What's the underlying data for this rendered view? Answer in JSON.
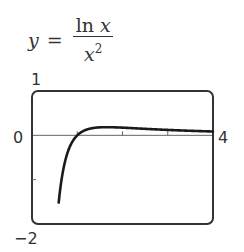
{
  "equation": {
    "lhs": "y",
    "equals": "=",
    "numerator_fn": "ln",
    "numerator_var": "x",
    "denominator_var": "x",
    "denominator_exp": "2"
  },
  "axis_labels": {
    "ymax": "1",
    "ymin": "−2",
    "xmin": "0",
    "xmax": "4"
  },
  "colors": {
    "frame": "#333333",
    "curve": "#1a1a1a",
    "axis": "#555555",
    "text": "#333333"
  },
  "chart_data": {
    "type": "line",
    "function": "ln(x)/x^2",
    "xlabel": "",
    "ylabel": "",
    "xlim": [
      0,
      4
    ],
    "ylim": [
      -2,
      1
    ],
    "x_tick_labels": [
      "0",
      "4"
    ],
    "y_tick_labels": [
      "1",
      "−2"
    ],
    "x_ticks": [
      1,
      2,
      3
    ],
    "y_ticks": [
      -1
    ],
    "grid": false,
    "legend": null,
    "series": [
      {
        "name": "y = ln x / x^2",
        "x": [
          0.6,
          0.7,
          0.8,
          0.9,
          1.0,
          1.25,
          1.5,
          1.65,
          2.0,
          2.5,
          3.0,
          3.5,
          4.0
        ],
        "values": [
          -1.42,
          -0.73,
          -0.35,
          -0.13,
          0.0,
          0.143,
          0.18,
          0.184,
          0.173,
          0.147,
          0.122,
          0.102,
          0.087
        ]
      }
    ]
  }
}
